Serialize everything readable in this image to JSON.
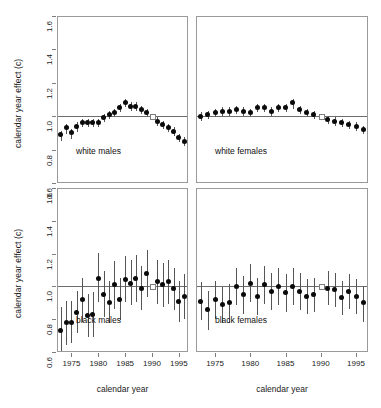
{
  "chart_data": {
    "type": "scatter",
    "title": "",
    "subtitle": "",
    "xlabel": "calendar year",
    "ylabel": "calendar year effect (c)",
    "xlim": [
      1972.3,
      1996.7
    ],
    "ylim": [
      0.6,
      1.6
    ],
    "yticks": [
      "1.6",
      "1.4",
      "1.2",
      "1.0",
      "0.8",
      "0.6"
    ],
    "ytick_values": [
      1.6,
      1.4,
      1.2,
      1.0,
      0.8,
      0.6
    ],
    "xticks": [
      "1975",
      "1980",
      "1985",
      "1990",
      "1995"
    ],
    "xtick_values": [
      1975,
      1980,
      1985,
      1990,
      1995
    ],
    "grid": false,
    "legend": "none",
    "reference_line": 1.0,
    "reference_point_year": 1990,
    "reference_point_value": 1.0,
    "marker_style": "filled-circle-with-vertical-error-bars",
    "reference_marker_style": "open-square",
    "panels": [
      {
        "id": "white-males",
        "label": "white males",
        "row": 0,
        "col": 0,
        "x": [
          1973,
          1974,
          1975,
          1976,
          1977,
          1978,
          1979,
          1980,
          1981,
          1982,
          1983,
          1984,
          1985,
          1986,
          1987,
          1988,
          1989,
          1990,
          1991,
          1992,
          1993,
          1994,
          1995,
          1996
        ],
        "y": [
          0.89,
          0.93,
          0.9,
          0.94,
          0.96,
          0.96,
          0.96,
          0.96,
          0.99,
          1.01,
          1.02,
          1.05,
          1.08,
          1.06,
          1.06,
          1.04,
          1.02,
          1.0,
          0.97,
          0.95,
          0.93,
          0.91,
          0.87,
          0.85
        ],
        "ylow": [
          0.86,
          0.9,
          0.87,
          0.91,
          0.94,
          0.94,
          0.94,
          0.94,
          0.97,
          0.99,
          1.0,
          1.03,
          1.06,
          1.04,
          1.04,
          1.02,
          1.0,
          1.0,
          0.95,
          0.93,
          0.91,
          0.89,
          0.85,
          0.83
        ],
        "yhigh": [
          0.92,
          0.96,
          0.93,
          0.97,
          0.99,
          0.99,
          0.99,
          0.99,
          1.02,
          1.04,
          1.05,
          1.08,
          1.11,
          1.09,
          1.09,
          1.07,
          1.05,
          1.0,
          1.0,
          0.98,
          0.96,
          0.94,
          0.9,
          0.88
        ]
      },
      {
        "id": "white-females",
        "label": "white females",
        "row": 0,
        "col": 1,
        "x": [
          1973,
          1974,
          1975,
          1976,
          1977,
          1978,
          1979,
          1980,
          1981,
          1982,
          1983,
          1984,
          1985,
          1986,
          1987,
          1988,
          1989,
          1990,
          1991,
          1992,
          1993,
          1994,
          1995,
          1996
        ],
        "y": [
          1.0,
          1.01,
          1.02,
          1.03,
          1.03,
          1.04,
          1.03,
          1.02,
          1.05,
          1.05,
          1.03,
          1.05,
          1.05,
          1.08,
          1.04,
          1.02,
          1.01,
          1.0,
          0.98,
          0.97,
          0.96,
          0.95,
          0.94,
          0.92
        ],
        "ylow": [
          0.98,
          0.99,
          1.0,
          1.01,
          1.01,
          1.02,
          1.01,
          1.0,
          1.03,
          1.03,
          1.01,
          1.03,
          1.03,
          1.05,
          1.02,
          1.0,
          0.99,
          1.0,
          0.96,
          0.95,
          0.94,
          0.93,
          0.92,
          0.9
        ],
        "yhigh": [
          1.03,
          1.04,
          1.05,
          1.06,
          1.06,
          1.07,
          1.06,
          1.05,
          1.08,
          1.08,
          1.06,
          1.08,
          1.08,
          1.11,
          1.07,
          1.05,
          1.04,
          1.0,
          1.01,
          1.0,
          0.99,
          0.98,
          0.97,
          0.95
        ]
      },
      {
        "id": "black-males",
        "label": "black males",
        "row": 1,
        "col": 0,
        "x": [
          1973,
          1974,
          1975,
          1976,
          1977,
          1978,
          1979,
          1980,
          1981,
          1982,
          1983,
          1984,
          1985,
          1986,
          1987,
          1988,
          1989,
          1990,
          1991,
          1992,
          1993,
          1994,
          1995,
          1996
        ],
        "y": [
          0.73,
          0.78,
          0.78,
          0.84,
          0.92,
          0.82,
          0.83,
          1.05,
          0.95,
          0.9,
          1.01,
          0.92,
          1.04,
          1.02,
          1.05,
          0.99,
          1.08,
          1.0,
          1.03,
          1.01,
          1.03,
          0.99,
          0.91,
          0.94
        ],
        "ylow": [
          0.6,
          0.65,
          0.66,
          0.72,
          0.79,
          0.7,
          0.7,
          0.91,
          0.82,
          0.78,
          0.87,
          0.8,
          0.91,
          0.89,
          0.91,
          0.86,
          0.94,
          1.0,
          0.9,
          0.88,
          0.9,
          0.86,
          0.79,
          0.81
        ],
        "yhigh": [
          0.88,
          0.92,
          0.92,
          0.98,
          1.06,
          0.96,
          0.97,
          1.21,
          1.1,
          1.04,
          1.16,
          1.06,
          1.19,
          1.17,
          1.2,
          1.13,
          1.23,
          1.0,
          1.17,
          1.15,
          1.17,
          1.12,
          1.04,
          1.08
        ]
      },
      {
        "id": "black-females",
        "label": "black females",
        "row": 1,
        "col": 1,
        "x": [
          1973,
          1974,
          1975,
          1976,
          1977,
          1978,
          1979,
          1980,
          1981,
          1982,
          1983,
          1984,
          1985,
          1986,
          1987,
          1988,
          1989,
          1990,
          1991,
          1992,
          1993,
          1994,
          1995,
          1996
        ],
        "y": [
          0.91,
          0.86,
          0.92,
          0.89,
          0.9,
          1.0,
          0.95,
          1.02,
          0.94,
          1.01,
          0.97,
          1.0,
          0.96,
          1.0,
          0.97,
          0.94,
          0.95,
          1.0,
          0.99,
          0.98,
          0.93,
          0.97,
          0.94,
          0.9
        ],
        "ylow": [
          0.8,
          0.74,
          0.81,
          0.78,
          0.78,
          0.89,
          0.84,
          0.91,
          0.83,
          0.9,
          0.86,
          0.89,
          0.85,
          0.89,
          0.86,
          0.84,
          0.85,
          1.0,
          0.89,
          0.88,
          0.83,
          0.87,
          0.84,
          0.79
        ],
        "yhigh": [
          1.03,
          0.98,
          1.04,
          1.0,
          1.02,
          1.12,
          1.07,
          1.14,
          1.06,
          1.13,
          1.09,
          1.12,
          1.08,
          1.12,
          1.09,
          1.05,
          1.06,
          1.0,
          1.1,
          1.09,
          1.04,
          1.08,
          1.05,
          1.01
        ]
      }
    ]
  },
  "axes": {
    "y_label_text": "calendar year effect (c)",
    "x_label_text": "calendar year"
  },
  "colors": {
    "point": "#0a0a0a",
    "error_bar": "#555555",
    "frame": "#9a9a9a",
    "reference_line": "#6d6d6d",
    "text": "#1a1a1a",
    "background": "#ffffff"
  }
}
